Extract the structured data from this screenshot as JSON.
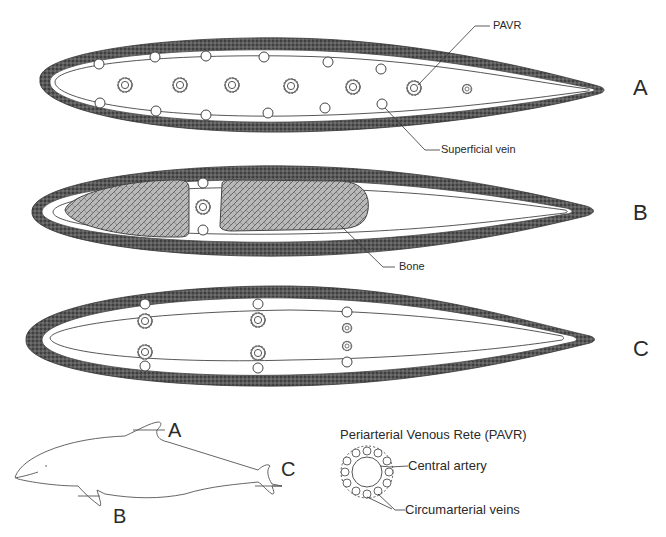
{
  "figure": {
    "colors": {
      "skin_band": "#555555",
      "outline": "#333333",
      "bone_fill": "#9a9a9a",
      "background": "#ffffff"
    }
  },
  "sections": [
    {
      "id": "A",
      "label": "A",
      "callouts": [
        {
          "text": "PAVR"
        },
        {
          "text": "Superficial vein"
        }
      ]
    },
    {
      "id": "B",
      "label": "B",
      "callouts": [
        {
          "text": "Bone"
        }
      ]
    },
    {
      "id": "C",
      "label": "C"
    }
  ],
  "dolphin_key": {
    "labels": [
      "A",
      "B",
      "C"
    ]
  },
  "legend": {
    "title": "Periarterial Venous Rete (PAVR)",
    "central": "Central artery",
    "circum": "Circumarterial veins"
  }
}
